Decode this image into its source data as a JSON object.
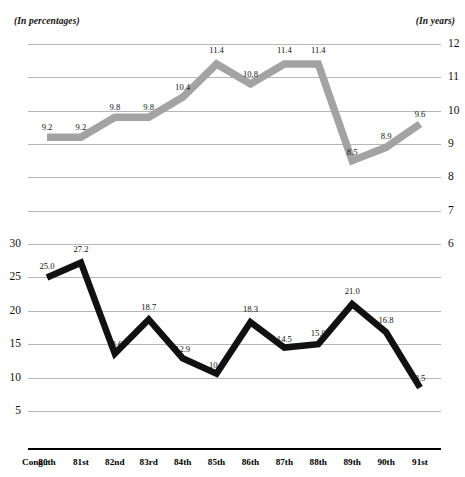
{
  "captions": {
    "left": "(In percentages)",
    "right": "(In years)"
  },
  "axis": {
    "category_prefix": "Cong.:"
  },
  "chart_data": [
    {
      "type": "line",
      "name": "years-of-service",
      "title": "",
      "xlabel": "",
      "ylabel": "(In years)",
      "axis_side": "right",
      "grid": true,
      "legend": "none",
      "color": "#a3a3a3",
      "ylim": [
        6,
        12
      ],
      "yticks": [
        12,
        11,
        10,
        9,
        8,
        7,
        6
      ],
      "categories": [
        "80th",
        "81st",
        "82nd",
        "83rd",
        "84th",
        "85th",
        "86th",
        "87th",
        "88th",
        "89th",
        "90th",
        "91st"
      ],
      "values": [
        9.2,
        9.2,
        9.8,
        9.8,
        10.4,
        11.4,
        10.8,
        11.4,
        11.4,
        8.5,
        8.9,
        9.6
      ],
      "labels": [
        "9.2",
        "9.2",
        "9.8",
        "9.8",
        "10.4",
        "11.4",
        "10.8",
        "11.4",
        "11.4",
        "8.5",
        "8.9",
        "9.6"
      ]
    },
    {
      "type": "line",
      "name": "percentage-turnover",
      "title": "",
      "xlabel": "",
      "ylabel": "(In percentages)",
      "axis_side": "left",
      "grid": true,
      "legend": "none",
      "color": "#111111",
      "ylim": [
        5,
        30
      ],
      "yticks": [
        30,
        25,
        20,
        15,
        10,
        5
      ],
      "categories": [
        "80th",
        "81st",
        "82nd",
        "83rd",
        "84th",
        "85th",
        "86th",
        "87th",
        "88th",
        "89th",
        "90th",
        "91st"
      ],
      "values": [
        25.0,
        27.2,
        13.6,
        18.7,
        12.9,
        10.6,
        18.3,
        14.5,
        15.0,
        21.0,
        16.8,
        8.5
      ],
      "labels": [
        "25.0",
        "27.2",
        "13.6",
        "18.7",
        "12.9",
        "10.6",
        "18.3",
        "14.5",
        "15.0",
        "21.0",
        "16.8",
        "8.5"
      ]
    }
  ]
}
